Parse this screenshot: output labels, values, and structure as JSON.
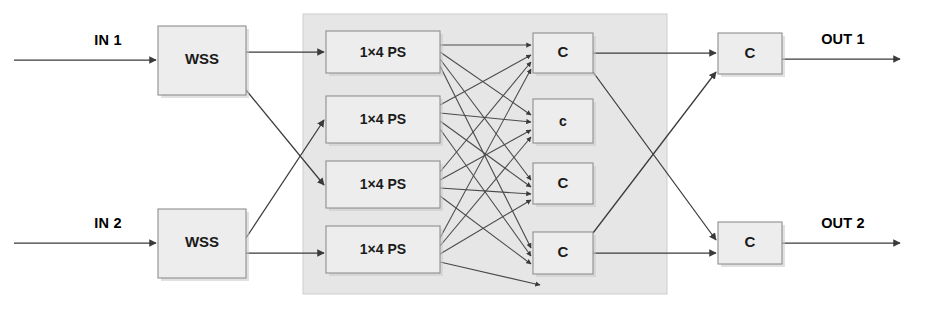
{
  "diagram": {
    "type": "block-diagram",
    "canvas": {
      "width": 932,
      "height": 310
    },
    "colors": {
      "background": "#ffffff",
      "box_fill": "#ededed",
      "box_stroke": "#8e8e8e",
      "container_fill": "#e4e4e4",
      "container_stroke": "#c9c9c9",
      "wire": "#3a3a3a",
      "text": "#1a1a1a"
    },
    "inputs": [
      {
        "id": "in1",
        "label": "IN 1",
        "label_x": 108,
        "label_y": 45,
        "line_y": 60,
        "line_x1": 14,
        "line_x2": 158
      },
      {
        "id": "in2",
        "label": "IN 2",
        "label_x": 108,
        "label_y": 228,
        "line_y": 243,
        "line_x1": 14,
        "line_x2": 158
      }
    ],
    "outputs": [
      {
        "id": "out1",
        "label": "OUT 1",
        "label_x": 843,
        "label_y": 44,
        "line_y": 59,
        "line_x1": 782,
        "line_x2": 902
      },
      {
        "id": "out2",
        "label": "OUT 2",
        "label_x": 843,
        "label_y": 228,
        "line_y": 243,
        "line_x1": 782,
        "line_x2": 902
      }
    ],
    "wss_boxes": [
      {
        "id": "wss1",
        "label": "WSS",
        "x": 158,
        "y": 26,
        "w": 88,
        "h": 69,
        "font_size": 15
      },
      {
        "id": "wss2",
        "label": "WSS",
        "x": 158,
        "y": 209,
        "w": 88,
        "h": 69,
        "font_size": 15
      }
    ],
    "ps_boxes": [
      {
        "id": "ps1",
        "label": "1×4 PS",
        "x": 326,
        "y": 31,
        "w": 114,
        "h": 42,
        "font_size": 14
      },
      {
        "id": "ps2",
        "label": "1×4 PS",
        "x": 326,
        "y": 96,
        "w": 114,
        "h": 47,
        "font_size": 14
      },
      {
        "id": "ps3",
        "label": "1×4 PS",
        "x": 326,
        "y": 161,
        "w": 114,
        "h": 47,
        "font_size": 14
      },
      {
        "id": "ps4",
        "label": "1×4 PS",
        "x": 326,
        "y": 226,
        "w": 114,
        "h": 47,
        "font_size": 14
      }
    ],
    "combiner_boxes": [
      {
        "id": "c1",
        "label": "C",
        "x": 533,
        "y": 33,
        "w": 60,
        "h": 40,
        "font_size": 15
      },
      {
        "id": "c2",
        "label": "c",
        "x": 533,
        "y": 99,
        "w": 60,
        "h": 44,
        "font_size": 14
      },
      {
        "id": "c3",
        "label": "C",
        "x": 533,
        "y": 163,
        "w": 60,
        "h": 41,
        "font_size": 15
      },
      {
        "id": "c4",
        "label": "C",
        "x": 533,
        "y": 232,
        "w": 60,
        "h": 42,
        "font_size": 15
      }
    ],
    "output_combiner_boxes": [
      {
        "id": "oc1",
        "label": "C",
        "x": 718,
        "y": 33,
        "w": 64,
        "h": 41,
        "font_size": 15
      },
      {
        "id": "oc2",
        "label": "C",
        "x": 718,
        "y": 222,
        "w": 64,
        "h": 42,
        "font_size": 15
      }
    ],
    "container": {
      "id": "switch-fabric",
      "x": 303,
      "y": 14,
      "w": 364,
      "h": 280
    },
    "connections": {
      "wss_to_ps": [
        {
          "from": "wss1",
          "to": "ps1"
        },
        {
          "from": "wss1",
          "to": "ps3"
        },
        {
          "from": "wss2",
          "to": "ps2"
        },
        {
          "from": "wss2",
          "to": "ps4"
        }
      ],
      "crossbar_note": "full 4x4 fan-out: every 1x4 PS connects to every C",
      "c_to_output_c": [
        {
          "from": "c1",
          "to": "oc1"
        },
        {
          "from": "c1",
          "to": "oc2"
        },
        {
          "from": "c4",
          "to": "oc1"
        },
        {
          "from": "c4",
          "to": "oc2"
        }
      ]
    }
  }
}
